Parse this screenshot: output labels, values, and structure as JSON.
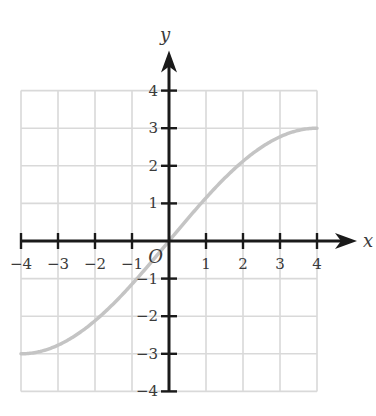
{
  "chart_data": {
    "type": "line",
    "title": "",
    "xlabel": "x",
    "ylabel": "y",
    "origin_label": "O",
    "xlim": [
      -4,
      4
    ],
    "ylim": [
      -4,
      4
    ],
    "grid": true,
    "x_ticks": [
      -4,
      -3,
      -2,
      -1,
      1,
      2,
      3,
      4
    ],
    "y_ticks": [
      4,
      3,
      2,
      1,
      -1,
      -2,
      -3,
      -4
    ],
    "x_tick_labels": [
      "-4",
      "-3",
      "-2",
      "-1",
      "1",
      "2",
      "3",
      "4"
    ],
    "y_tick_labels": [
      "4",
      "3",
      "2",
      "1",
      "-1",
      "-2",
      "-3",
      "-4"
    ],
    "series": [
      {
        "name": "curve",
        "description": "S-shaped curve through origin, approx. y = 3 sin(pi x / 8)",
        "x": [
          -4,
          -3,
          -2,
          -1,
          0,
          1,
          2,
          3,
          4
        ],
        "y": [
          -3.0,
          -2.77,
          -2.12,
          -1.15,
          0,
          1.15,
          2.12,
          2.77,
          3.0
        ]
      }
    ],
    "colors": {
      "grid": "#d9d9d9",
      "axes": "#1a1a1a",
      "curve": "#c4c4c4",
      "text": "#3a3a3a"
    }
  },
  "layout": {
    "origin_px": [
      169,
      241
    ],
    "unit_px_x": 37,
    "unit_px_y": 37.6
  }
}
